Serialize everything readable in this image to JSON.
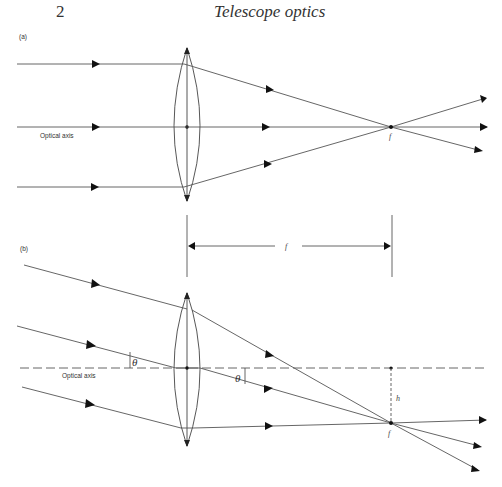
{
  "header": {
    "page_number": "2",
    "running_title": "Telescope optics"
  },
  "figure": {
    "panel_a": {
      "label": "(a)",
      "axis_label": "Optical axis",
      "focal_point_label": "f"
    },
    "panel_b": {
      "label": "(b)",
      "axis_label": "Optical axis",
      "focal_length_label": "f",
      "angle_label": "θ",
      "angle_label_2": "θ",
      "height_label": "h",
      "focal_point_label": "f"
    }
  },
  "colors": {
    "line": "#555555",
    "text": "#333333",
    "background": "#ffffff"
  }
}
